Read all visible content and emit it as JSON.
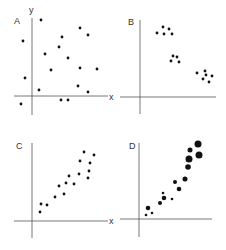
{
  "figure": {
    "axis_labels": {
      "x": "x",
      "y": "y"
    }
  },
  "chart_data": [
    {
      "type": "scatter",
      "panel": "A",
      "title": "A",
      "xlabel": "x",
      "ylabel": "y",
      "pattern": "no correlation (random scatter)",
      "axes": {
        "origin": [
          32,
          96
        ],
        "x_extent": [
          14,
          108
        ],
        "y_extent": [
          18,
          115
        ]
      },
      "points": [
        [
          41,
          20
        ],
        [
          23,
          41
        ],
        [
          80,
          28
        ],
        [
          88,
          35
        ],
        [
          62,
          37
        ],
        [
          59,
          47
        ],
        [
          45,
          54
        ],
        [
          68,
          58
        ],
        [
          51,
          70
        ],
        [
          80,
          68
        ],
        [
          97,
          69
        ],
        [
          25,
          78
        ],
        [
          39,
          90
        ],
        [
          78,
          86
        ],
        [
          88,
          92
        ],
        [
          61,
          100
        ],
        [
          68,
          100
        ],
        [
          21,
          104
        ]
      ],
      "point_radius": 1.4
    },
    {
      "type": "scatter",
      "panel": "B",
      "title": "B",
      "xlabel": "x",
      "ylabel": "",
      "pattern": "three clusters, negative trend",
      "axes": {
        "origin": [
          140,
          97
        ],
        "x_extent": [
          120,
          216
        ],
        "y_extent": [
          20,
          114
        ]
      },
      "points": [
        [
          163,
          27
        ],
        [
          169,
          29
        ],
        [
          157,
          33
        ],
        [
          164,
          34
        ],
        [
          172,
          34
        ],
        [
          173,
          56
        ],
        [
          177,
          57
        ],
        [
          171,
          61
        ],
        [
          179,
          62
        ],
        [
          197,
          73
        ],
        [
          205,
          71
        ],
        [
          212,
          76
        ],
        [
          206,
          75
        ],
        [
          203,
          79
        ],
        [
          209,
          82
        ]
      ],
      "point_radius": 1.4
    },
    {
      "type": "scatter",
      "panel": "C",
      "title": "C",
      "xlabel": "x",
      "ylabel": "",
      "pattern": "positive linear correlation",
      "axes": {
        "origin": [
          32,
          221
        ],
        "x_extent": [
          14,
          108
        ],
        "y_extent": [
          143,
          238
        ]
      },
      "points": [
        [
          84,
          152
        ],
        [
          94,
          155
        ],
        [
          80,
          161
        ],
        [
          90,
          163
        ],
        [
          89,
          171
        ],
        [
          79,
          174
        ],
        [
          69,
          176
        ],
        [
          88,
          178
        ],
        [
          66,
          183
        ],
        [
          59,
          186
        ],
        [
          74,
          184
        ],
        [
          64,
          194
        ],
        [
          55,
          197
        ],
        [
          41,
          204
        ],
        [
          47,
          205
        ],
        [
          40,
          212
        ]
      ],
      "point_radius": 1.4
    },
    {
      "type": "scatter",
      "panel": "D",
      "title": "D",
      "xlabel": "x",
      "ylabel": "",
      "pattern": "positive correlation, bubble size increasing (heteroscedastic)",
      "axes": {
        "origin": [
          139,
          219
        ],
        "x_extent": [
          120,
          212
        ],
        "y_extent": [
          143,
          237
        ]
      },
      "points": [
        [
          198,
          144,
          3.5
        ],
        [
          199,
          155,
          3.5
        ],
        [
          190,
          150,
          2.5
        ],
        [
          189,
          159,
          3.5
        ],
        [
          188,
          167,
          2.8
        ],
        [
          185,
          179,
          2.5
        ],
        [
          175,
          182,
          2.0
        ],
        [
          179,
          189,
          2.3
        ],
        [
          163,
          193,
          1.3
        ],
        [
          164,
          198,
          2.3
        ],
        [
          172,
          199,
          1.3
        ],
        [
          160,
          203,
          2.0
        ],
        [
          148,
          208,
          2.3
        ],
        [
          152,
          213,
          1.3
        ],
        [
          146,
          215,
          1.3
        ]
      ]
    }
  ],
  "labels": [
    {
      "text": "A",
      "x": 14,
      "y": 24
    },
    {
      "text": "y",
      "x": 29,
      "y": 13
    },
    {
      "text": "x",
      "x": 109,
      "y": 100
    },
    {
      "text": "B",
      "x": 128,
      "y": 25
    },
    {
      "text": "C",
      "x": 16,
      "y": 149
    },
    {
      "text": "x",
      "x": 109,
      "y": 224
    },
    {
      "text": "D",
      "x": 129,
      "y": 149
    }
  ]
}
